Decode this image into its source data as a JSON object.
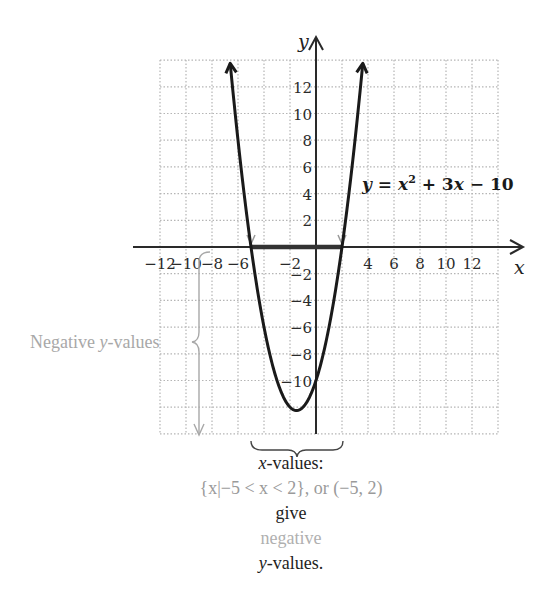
{
  "chart_data": {
    "type": "line",
    "title": "",
    "equation_label": "y = x² + 3x − 10",
    "function": "x^2 + 3x - 10",
    "xlabel": "x",
    "ylabel": "y",
    "xlim": [
      -12,
      14
    ],
    "ylim": [
      -14,
      14
    ],
    "grid": true,
    "x_ticks": [
      -12,
      -10,
      -8,
      -6,
      -2,
      4,
      6,
      8,
      10,
      12
    ],
    "y_ticks": [
      12,
      10,
      8,
      6,
      4,
      2,
      -2,
      -4,
      -6,
      -8,
      -10
    ],
    "series": [
      {
        "name": "y = x^2 + 3x - 10",
        "x": [
          -6.67,
          -6,
          -5,
          -4,
          -3,
          -2,
          -1.5,
          -1,
          0,
          1,
          2,
          3,
          3.67
        ],
        "y": [
          14.5,
          8,
          0,
          -6,
          -10,
          -12,
          -12.25,
          -12,
          -10,
          -6,
          0,
          8,
          14.5
        ]
      }
    ],
    "vertex": [
      -1.5,
      -12.25
    ],
    "x_intercepts": [
      -5,
      2
    ],
    "highlighted_interval": [
      -5,
      2
    ],
    "annotations": [
      "Negative y-values",
      "x-values:",
      "{x|−5 < x < 2}, or (−5, 2)",
      "give",
      "negative",
      "y-values."
    ]
  },
  "labels": {
    "x_axis": "x",
    "y_axis": "y",
    "equation_y": "y",
    "equation_eq": " = ",
    "equation_x": "x",
    "equation_sup": "2",
    "equation_rest": " + 3",
    "equation_x2": "x",
    "equation_tail": " − 10",
    "negative_y_prefix": "Negative ",
    "negative_y_var": "y",
    "negative_y_suffix": "-values",
    "xvalues_var": "x",
    "xvalues_suffix": "-values:",
    "set_notation": "{x|−5 < x < 2}, or (−5, 2)",
    "give": "give",
    "negative": "negative",
    "yvalues_var": "y",
    "yvalues_suffix": "-values."
  },
  "colors": {
    "curve": "#1a1a1a",
    "axis": "#2a2a2a",
    "grid": "#b5b5b5",
    "annotation_gray": "#a8a8a8"
  }
}
